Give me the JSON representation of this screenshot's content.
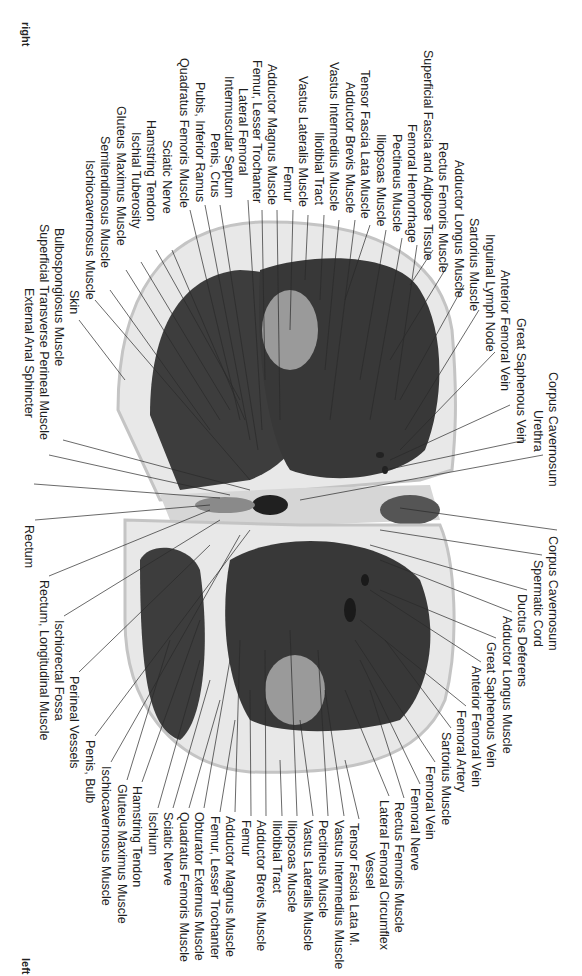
{
  "orientation": {
    "top_left": "right",
    "bottom_left": "left"
  },
  "colors": {
    "background": "#ffffff",
    "fat": "#e6e6e6",
    "skin": "#cfcfcf",
    "muscle": "#3c3c3c",
    "bone": "#9a9a9a",
    "leader": "#2a2a2a",
    "text": "#1e1e1e"
  },
  "labels_top": [
    {
      "text": "Quadratus Femoris Muscle",
      "x": 183,
      "y": 58
    },
    {
      "text": "Pubis, Inferior Ramus",
      "x": 199,
      "y": 82
    },
    {
      "text": "Penis, Crus",
      "x": 214,
      "y": 133
    },
    {
      "text": "Lateral Femoral",
      "x": 242,
      "y": 88
    },
    {
      "text": "Intermuscular Septum",
      "x": 228,
      "y": 76
    },
    {
      "text": "Femur, Lesser Trochanter",
      "x": 256,
      "y": 60
    },
    {
      "text": "Adductor Magnus Muscle",
      "x": 271,
      "y": 64
    },
    {
      "text": "Femur",
      "x": 287,
      "y": 166
    },
    {
      "text": "Vastus Lateralis Muscle",
      "x": 302,
      "y": 76
    },
    {
      "text": "Iliotibial Tract",
      "x": 318,
      "y": 132
    },
    {
      "text": "Vastus Intermedius Muscle",
      "x": 333,
      "y": 62
    },
    {
      "text": "Adductor Brevis Muscle",
      "x": 349,
      "y": 82
    },
    {
      "text": "Tensor Fascia Lata Muscle",
      "x": 364,
      "y": 70
    },
    {
      "text": "Iliopsoas Muscle",
      "x": 380,
      "y": 134
    },
    {
      "text": "Pectineus Muscle",
      "x": 396,
      "y": 134
    },
    {
      "text": "Femoral Hemorrhage",
      "x": 411,
      "y": 124
    },
    {
      "text": "Superficial Fascia and Adipose Tissue",
      "x": 427,
      "y": 50
    },
    {
      "text": "Rectus Femoris Muscle",
      "x": 442,
      "y": 142
    },
    {
      "text": "Adductor Longus Muscle",
      "x": 458,
      "y": 160
    },
    {
      "text": "Sartorius Muscle",
      "x": 473,
      "y": 218
    },
    {
      "text": "Inguinal Lymph Node",
      "x": 489,
      "y": 234
    },
    {
      "text": "Anterior Femoral Vein",
      "x": 504,
      "y": 270
    },
    {
      "text": "Great Saphenous Vein",
      "x": 520,
      "y": 318
    },
    {
      "text": "Urethra",
      "x": 537,
      "y": 410
    },
    {
      "text": "Corpus Cavernosum",
      "x": 552,
      "y": 372
    },
    {
      "text": "Sciatic Nerve",
      "x": 166,
      "y": 140
    },
    {
      "text": "Hamstring Tendon",
      "x": 150,
      "y": 120
    },
    {
      "text": "Ischial Tuberosity",
      "x": 135,
      "y": 132
    },
    {
      "text": "Gluteus Maximus Muscle",
      "x": 120,
      "y": 106
    },
    {
      "text": "Semitendinosus Muscle",
      "x": 104,
      "y": 136
    },
    {
      "text": "Ischiocavernosus Muscle",
      "x": 89,
      "y": 160
    },
    {
      "text": "Skin",
      "x": 73,
      "y": 290
    },
    {
      "text": "Bulbospongiosus Muscle",
      "x": 58,
      "y": 228
    },
    {
      "text": "Superficial Transverse Perineal Muscle",
      "x": 43,
      "y": 224
    },
    {
      "text": "External Anal Sphincter",
      "x": 28,
      "y": 288
    },
    {
      "text": "Rectum",
      "x": 28,
      "y": 525
    }
  ],
  "labels_bottom": [
    {
      "text": "Corpus Cavernosum",
      "x": 552,
      "y": 536
    },
    {
      "text": "Spermatic Cord",
      "x": 537,
      "y": 560
    },
    {
      "text": "Ductus Deferens",
      "x": 521,
      "y": 594
    },
    {
      "text": "Adductor Longus Muscle",
      "x": 506,
      "y": 616
    },
    {
      "text": "Great Saphenous Vein",
      "x": 490,
      "y": 642
    },
    {
      "text": "Anterior Femoral Vein",
      "x": 475,
      "y": 666
    },
    {
      "text": "Femoral Artery",
      "x": 460,
      "y": 710
    },
    {
      "text": "Sartorius Muscle",
      "x": 445,
      "y": 732
    },
    {
      "text": "Femoral Vein",
      "x": 429,
      "y": 766
    },
    {
      "text": "Femoral Nerve",
      "x": 414,
      "y": 788
    },
    {
      "text": "Rectus Femoris Muscle",
      "x": 398,
      "y": 802
    },
    {
      "text": "Lateral Femoral Circumflex",
      "x": 383,
      "y": 800
    },
    {
      "text": "Vessel",
      "x": 369,
      "y": 852
    },
    {
      "text": "Tensor Fascia Lata M.",
      "x": 353,
      "y": 823
    },
    {
      "text": "Vastus Intermedius Muscle",
      "x": 338,
      "y": 820
    },
    {
      "text": "Pectineus Muscle",
      "x": 322,
      "y": 820
    },
    {
      "text": "Vastus Lateralis Muscle",
      "x": 307,
      "y": 820
    },
    {
      "text": "Iliopsoas Muscle",
      "x": 291,
      "y": 820
    },
    {
      "text": "Iliotibial Tract",
      "x": 276,
      "y": 820
    },
    {
      "text": "Adductor Brevis Muscle",
      "x": 260,
      "y": 820
    },
    {
      "text": "Femur",
      "x": 245,
      "y": 820
    },
    {
      "text": "Adductor Magnus Muscle",
      "x": 229,
      "y": 816
    },
    {
      "text": "Femur, Lesser Trochanter",
      "x": 214,
      "y": 816
    },
    {
      "text": "Obturator Externus Muscle",
      "x": 198,
      "y": 812
    },
    {
      "text": "Quadratus Femoris Muscle",
      "x": 183,
      "y": 812
    },
    {
      "text": "Sciatic Nerve",
      "x": 167,
      "y": 812
    },
    {
      "text": "Ischium",
      "x": 152,
      "y": 812
    },
    {
      "text": "Hamstring Tendon",
      "x": 136,
      "y": 786
    },
    {
      "text": "Gluteus Maximus Muscle",
      "x": 121,
      "y": 784
    },
    {
      "text": "Ischiocavernosus Muscle",
      "x": 105,
      "y": 766
    },
    {
      "text": "Penis, Bulb",
      "x": 89,
      "y": 740
    },
    {
      "text": "Perineal Vessels",
      "x": 73,
      "y": 676
    },
    {
      "text": "Ischiorectal Fossa",
      "x": 58,
      "y": 620
    },
    {
      "text": "Rectum, Longitudinal Muscle",
      "x": 43,
      "y": 580
    }
  ]
}
